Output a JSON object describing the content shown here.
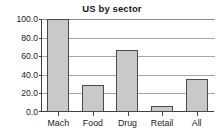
{
  "chart_data": {
    "type": "bar",
    "title": "US by sector",
    "xlabel": "",
    "ylabel": "",
    "categories": [
      "Mach",
      "Food",
      "Drug",
      "Retail",
      "All"
    ],
    "values": [
      100.0,
      29.0,
      67.0,
      7.0,
      35.0
    ],
    "ylim": [
      0.0,
      100.0
    ],
    "yticks": [
      0.0,
      20.0,
      40.0,
      60.0,
      80.0,
      100.0
    ],
    "ytick_labels": [
      "0.0",
      "20.0",
      "40.0",
      "60.0",
      "80.0",
      "100.0"
    ],
    "grid": true,
    "grid_axis": "y",
    "legend": false,
    "legend_position": "none",
    "bar_fill_color": "#c9c9c9",
    "bar_edge_color": "#4a4a4a",
    "axis_color": "#3f3f3f",
    "gridline_color": "#a6a6a6",
    "text_color": "#1a1a1a",
    "background_color": "#ffffff"
  }
}
